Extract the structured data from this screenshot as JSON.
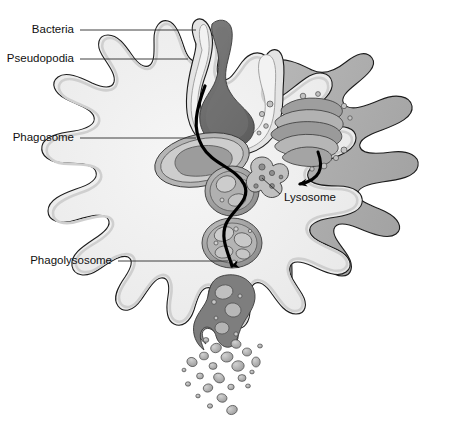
{
  "figure": {
    "background_color": "#ffffff"
  },
  "labels": [
    {
      "id": "bacteria",
      "text": "Bacteria",
      "text_x": 74,
      "text_y": 30,
      "leader": "M 80 30 L 196 30",
      "anchor": "end"
    },
    {
      "id": "pseudopodia",
      "text": "Pseudopodia",
      "text_x": 74,
      "text_y": 59,
      "leader": "M 80 59 L 188 59",
      "anchor": "end"
    },
    {
      "id": "phagosome",
      "text": "Phagosome",
      "text_x": 74,
      "text_y": 138,
      "leader": "M 80 138 L 196 138",
      "anchor": "end"
    },
    {
      "id": "lysosome",
      "text": "Lysosome",
      "text_x": 284,
      "text_y": 198,
      "leader": "M 280 194 L 262 178",
      "anchor": "start"
    },
    {
      "id": "phagolysosome",
      "text": "Phagolysosome",
      "text_x": 112,
      "text_y": 261,
      "leader": "M 118 261 L 228 261",
      "anchor": "end"
    }
  ],
  "colors": {
    "cell_cytoplasm": "#f0f0f0",
    "cell_body_dark": "#adadad",
    "membrane_band": "#d7d7d7",
    "membrane_line": "#1c1c1c",
    "bacteria_dark": "#6c6c6c",
    "bacteria_mid": "#8a8a8a",
    "organelle_fill": "#9a9a9a",
    "organelle_light": "#bdbdbd",
    "vesicle_fill": "#a6a6a6",
    "vesicle_highlight": "#c9c9c9",
    "golgi_fill": "#9e9e9e",
    "golgi_light": "#c0c0c0",
    "debris": "#8f8f8f",
    "path_black": "#000000",
    "label_text": "#111111"
  },
  "structures": {
    "cell": {
      "name": "macrophage-cell-body",
      "description": "amoeboid cell with lobed pseudopodia"
    },
    "pseudopodia_arms": {
      "left_arm": "engulfing arm left of bacterium",
      "right_arm": "engulfing arm right of bacterium"
    },
    "bacteria": {
      "name": "bacterium-being-engulfed",
      "state": "external, between pseudopodia"
    },
    "phagosome": {
      "name": "phagosome-vesicle",
      "contents": "internalized bacterium"
    },
    "lysosome": {
      "name": "lysosome-vesicle",
      "shape": "cloverleaf with granules"
    },
    "golgi": {
      "name": "golgi-apparatus",
      "cisternae": 5,
      "budding_vesicles": 12
    },
    "fusion_arrow": {
      "name": "lysosome-fusion-arrow",
      "direction": "from golgi down-left to phagosome"
    },
    "phagolysosome": {
      "name": "phagolysosome-vesicle",
      "contents": "digesting bacterium and vesicles"
    },
    "residual_body": {
      "name": "residual-body",
      "state": "exocytosis at lower membrane"
    },
    "debris_count": 24,
    "process_path": {
      "name": "phagocytosis-process-path",
      "description": "black S-curve from bacterium down through vesicles to exocytosis"
    }
  }
}
